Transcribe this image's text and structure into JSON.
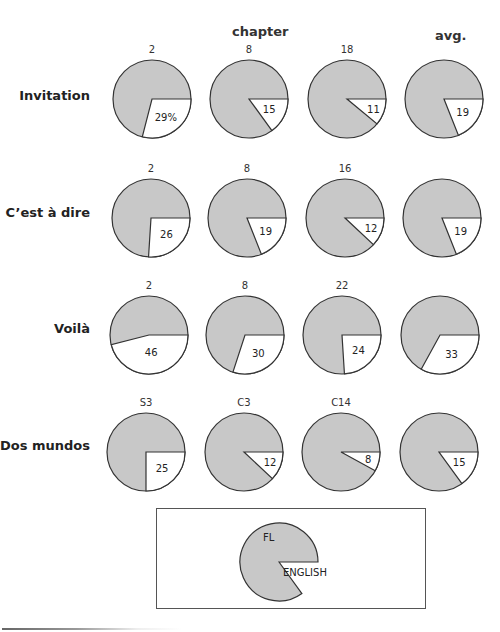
{
  "header": {
    "column_label": "chapter",
    "avg_label": "avg."
  },
  "colors": {
    "fl_fill": "#c8c8c8",
    "english_fill": "#ffffff",
    "stroke": "#333333"
  },
  "rows": [
    {
      "label": "Invitation",
      "cy": 99,
      "label_y": 88,
      "pies": [
        {
          "chapter": "2",
          "value": 29,
          "display": "29%",
          "cx": 152
        },
        {
          "chapter": "8",
          "value": 15,
          "display": "15",
          "cx": 249
        },
        {
          "chapter": "18",
          "value": 11,
          "display": "11",
          "cx": 347
        },
        {
          "chapter": "",
          "value": 19,
          "display": "19",
          "cx": 444
        }
      ]
    },
    {
      "label": "C’est à dire",
      "cy": 218,
      "label_y": 205,
      "pies": [
        {
          "chapter": "2",
          "value": 26,
          "display": "26",
          "cx": 151
        },
        {
          "chapter": "8",
          "value": 19,
          "display": "19",
          "cx": 247
        },
        {
          "chapter": "16",
          "value": 12,
          "display": "12",
          "cx": 345
        },
        {
          "chapter": "",
          "value": 19,
          "display": "19",
          "cx": 442
        }
      ]
    },
    {
      "label": "Voilà",
      "cy": 335,
      "label_y": 321,
      "pies": [
        {
          "chapter": "2",
          "value": 46,
          "display": "46",
          "cx": 149
        },
        {
          "chapter": "8",
          "value": 30,
          "display": "30",
          "cx": 245
        },
        {
          "chapter": "22",
          "value": 24,
          "display": "24",
          "cx": 342
        },
        {
          "chapter": "",
          "value": 33,
          "display": "33",
          "cx": 440
        }
      ]
    },
    {
      "label": "Dos mundos",
      "cy": 452,
      "label_y": 438,
      "pies": [
        {
          "chapter": "S3",
          "value": 25,
          "display": "25",
          "cx": 146
        },
        {
          "chapter": "C3",
          "value": 12,
          "display": "12",
          "cx": 244
        },
        {
          "chapter": "C14",
          "value": 8,
          "display": "8",
          "cx": 341
        },
        {
          "chapter": "",
          "value": 15,
          "display": "15",
          "cx": 439
        }
      ]
    }
  ],
  "legend": {
    "fl_label": "FL",
    "english_label": "ENGLISH",
    "english_share": 15
  },
  "chart_data": {
    "type": "pie",
    "title": "",
    "column_header": "chapter",
    "avg_header": "avg.",
    "legend": [
      "FL",
      "ENGLISH"
    ],
    "series": [
      {
        "name": "Invitation",
        "categories": [
          "2",
          "8",
          "18",
          "avg."
        ],
        "values": [
          29,
          15,
          11,
          19
        ]
      },
      {
        "name": "C’est à dire",
        "categories": [
          "2",
          "8",
          "16",
          "avg."
        ],
        "values": [
          26,
          19,
          12,
          19
        ]
      },
      {
        "name": "Voilà",
        "categories": [
          "2",
          "8",
          "22",
          "avg."
        ],
        "values": [
          46,
          30,
          24,
          33
        ]
      },
      {
        "name": "Dos mundos",
        "categories": [
          "S3",
          "C3",
          "C14",
          "avg."
        ],
        "values": [
          25,
          12,
          8,
          15
        ]
      }
    ],
    "unit": "%"
  }
}
